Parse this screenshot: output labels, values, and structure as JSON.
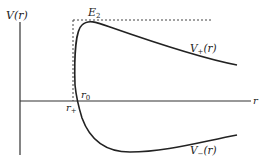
{
  "diagram": {
    "axes": {
      "y_label": "V(r)",
      "x_label": "r"
    },
    "levels": {
      "energy_label": "E",
      "energy_sub": "2"
    },
    "markers": {
      "r_plus_base": "r",
      "r_plus_sub": "+",
      "r_zero_base": "r",
      "r_zero_sub": "0"
    },
    "curves": {
      "upper_base": "V",
      "upper_sub": "+",
      "upper_arg": "(r)",
      "lower_base": "V",
      "lower_sub": "−",
      "lower_arg": "(r)"
    },
    "colors": {
      "line": "#222222",
      "background": "#ffffff"
    }
  }
}
